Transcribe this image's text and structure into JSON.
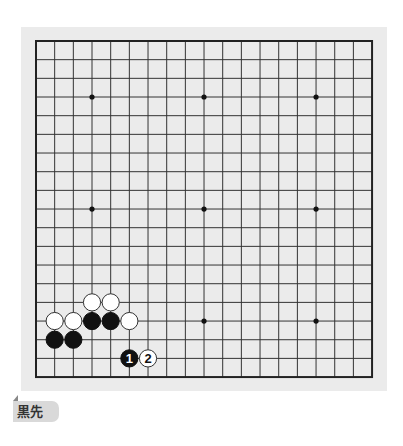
{
  "board": {
    "size": 19,
    "origin_x": 36,
    "origin_y": 41,
    "spacing": 18.67,
    "background": "#ebebeb",
    "line_color": "#333333",
    "star_points": [
      [
        3,
        3
      ],
      [
        9,
        3
      ],
      [
        15,
        3
      ],
      [
        3,
        9
      ],
      [
        9,
        9
      ],
      [
        15,
        9
      ],
      [
        3,
        15
      ],
      [
        9,
        15
      ],
      [
        15,
        15
      ]
    ],
    "stones": [
      {
        "color": "white",
        "col": 3,
        "row": 14
      },
      {
        "color": "white",
        "col": 4,
        "row": 14
      },
      {
        "color": "white",
        "col": 1,
        "row": 15
      },
      {
        "color": "white",
        "col": 2,
        "row": 15
      },
      {
        "color": "black",
        "col": 3,
        "row": 15
      },
      {
        "color": "black",
        "col": 4,
        "row": 15
      },
      {
        "color": "white",
        "col": 5,
        "row": 15
      },
      {
        "color": "black",
        "col": 1,
        "row": 16
      },
      {
        "color": "black",
        "col": 2,
        "row": 16
      }
    ],
    "moves": [
      {
        "number": "1",
        "color": "black",
        "col": 5,
        "row": 17
      },
      {
        "number": "2",
        "color": "white",
        "col": 6,
        "row": 17
      }
    ]
  },
  "caption": {
    "label": "黒先"
  }
}
